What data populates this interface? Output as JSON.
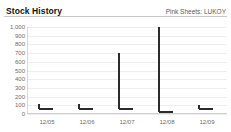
{
  "header": {
    "title": "Stock History",
    "ticker": "Pink Sheets: LUKOY"
  },
  "chart_data": {
    "type": "bar",
    "title": "Stock History",
    "subtitle": "Pink Sheets: LUKOY",
    "xlabel": "",
    "ylabel": "",
    "grid": true,
    "legend": "none",
    "ylim": [
      0,
      1000
    ],
    "yticks": [
      "1,000",
      "900",
      "800",
      "700",
      "600",
      "500",
      "400",
      "300",
      "200",
      "100",
      "0"
    ],
    "ytick_values": [
      1000,
      900,
      800,
      700,
      600,
      500,
      400,
      300,
      200,
      100,
      0
    ],
    "categories": [
      "12/05",
      "12/06",
      "12/07",
      "12/08",
      "12/09"
    ],
    "series": [
      {
        "name": "High",
        "values": [
          110,
          120,
          700,
          1000,
          105
        ]
      },
      {
        "name": "Close",
        "values": [
          55,
          60,
          55,
          20,
          55
        ]
      }
    ],
    "points": [
      {
        "label": "12/05",
        "high": 110,
        "low": 55,
        "close": 55
      },
      {
        "label": "12/06",
        "high": 120,
        "low": 60,
        "close": 60
      },
      {
        "label": "12/07",
        "high": 700,
        "low": 55,
        "close": 55
      },
      {
        "label": "12/08",
        "high": 1000,
        "low": 20,
        "close": 20
      },
      {
        "label": "12/09",
        "high": 105,
        "low": 55,
        "close": 55
      }
    ]
  },
  "colors": {
    "marker": "#2b2b2b",
    "gridline": "#ededed",
    "axis": "#d0d0d0",
    "label": "#6b6b6b",
    "title": "#111111",
    "background": "#ffffff"
  }
}
